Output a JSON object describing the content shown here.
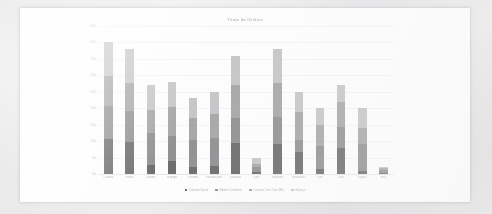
{
  "card": {
    "background_color": "#fdfdfd",
    "page_background_color": "#ececed"
  },
  "chart_data": {
    "type": "bar",
    "stacked": true,
    "title": "Título do Gráfico",
    "xlabel": "",
    "ylabel": "",
    "ylim": [
      0,
      45
    ],
    "yticks": [
      0,
      5,
      10,
      15,
      20,
      25,
      30,
      35,
      40,
      45
    ],
    "ytick_labels": [
      "0,0",
      "5,0",
      "10,0",
      "15,0",
      "20,0",
      "25,0",
      "30,0",
      "35,0",
      "40,0",
      "45,0"
    ],
    "grid": true,
    "legend_position": "bottom",
    "categories": [
      "Caldeira",
      "Pátera",
      "Lunares",
      "Rodrigo",
      "Ricardo",
      "Ricardo Neto",
      "Leonardo",
      "Lobo",
      "Edwards",
      "Emmanuel",
      "Dias",
      "Leão",
      "Regina",
      "Silva"
    ],
    "series": [
      {
        "name": "Contrato Social",
        "color": "#3c3c3e",
        "values": [
          10.5,
          9.6,
          2.6,
          4.0,
          2.2,
          2.4,
          9.4,
          0.6,
          9.0,
          6.6,
          1.6,
          8.0,
          1.0,
          0.4
        ]
      },
      {
        "name": "Médias Contábeis",
        "color": "#6e6e72",
        "values": [
          10.3,
          9.6,
          9.8,
          7.5,
          8.0,
          8.6,
          7.6,
          1.4,
          8.4,
          3.6,
          6.8,
          6.4,
          8.0,
          0.8
        ]
      },
      {
        "name": "Contrato Com Caso Mês",
        "color": "#8b8b8f",
        "values": [
          9.0,
          8.5,
          7.0,
          9.0,
          6.8,
          7.2,
          10.2,
          1.0,
          10.4,
          8.8,
          6.4,
          7.6,
          5.0,
          0.6
        ]
      },
      {
        "name": "Balanço",
        "color": "#b4b4b8",
        "values": [
          10.2,
          10.3,
          7.6,
          7.5,
          6.0,
          6.8,
          8.8,
          2.0,
          10.2,
          6.0,
          5.2,
          5.0,
          6.0,
          0.4
        ]
      }
    ]
  },
  "legend": {
    "items": [
      {
        "label": "Contrato Social",
        "color": "#3c3c3e"
      },
      {
        "label": "Médias Contábeis",
        "color": "#6e6e72"
      },
      {
        "label": "Contrato Com Caso Mês",
        "color": "#8b8b8f"
      },
      {
        "label": "Balanço",
        "color": "#b4b4b8"
      }
    ]
  }
}
